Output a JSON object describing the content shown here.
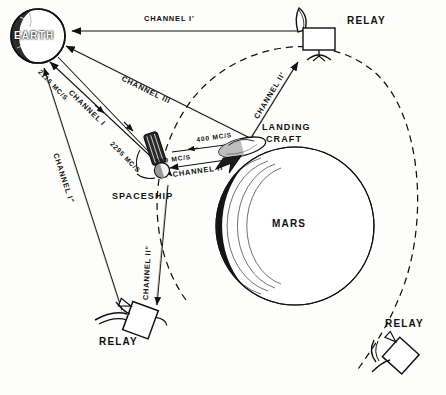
{
  "diagram": {
    "ink_color": "#111111",
    "paper_color": "#fdfdfb"
  },
  "bodies": [
    {
      "id": "earth",
      "label": "EARTH",
      "type": "planet"
    },
    {
      "id": "mars",
      "label": "MARS",
      "type": "planet"
    }
  ],
  "craft": [
    {
      "id": "spaceship",
      "label": "SPACESHIP",
      "type": "orbiter"
    },
    {
      "id": "landing-craft",
      "label": "LANDING\nCRAFT",
      "label_line1": "LANDING",
      "label_line2": "CRAFT",
      "type": "lander"
    },
    {
      "id": "relay-top",
      "label": "RELAY",
      "type": "relay-satellite"
    },
    {
      "id": "relay-bottom",
      "label": "RELAY",
      "type": "relay-satellite"
    },
    {
      "id": "relay-right",
      "label": "RELAY",
      "type": "relay-satellite"
    }
  ],
  "channels": [
    {
      "id": "channel-1-prime",
      "label": "CHANNEL I'",
      "from": "relay-top",
      "to": "earth"
    },
    {
      "id": "channel-3",
      "label": "CHANNEL III",
      "from": "landing-craft",
      "to": "earth"
    },
    {
      "id": "channel-1",
      "label": "CHANNEL I",
      "from": "spaceship",
      "to": "earth",
      "frequency_up": "2115 MC/S",
      "frequency_down": "2295 MC/S"
    },
    {
      "id": "channel-1-dprime",
      "label": "CHANNEL I\"",
      "from": "relay-bottom",
      "to": "earth"
    },
    {
      "id": "channel-2",
      "label": "CHANNEL II",
      "from": "landing-craft",
      "to": "spaceship",
      "frequency_up": "400 MC/S",
      "frequency_down": "380 MC/S"
    },
    {
      "id": "channel-2-prime",
      "label": "CHANNEL II'",
      "from": "landing-craft",
      "to": "relay-top"
    },
    {
      "id": "channel-2-dprime",
      "label": "CHANNEL II\"",
      "from": "spaceship",
      "to": "relay-bottom"
    }
  ],
  "frequencies": {
    "uplink_earth": "2115 MC/S",
    "downlink_earth": "2295 MC/S",
    "uplink_local": "400 MC/S",
    "downlink_local": "380 MC/S"
  },
  "labels": {
    "earth": "EARTH",
    "mars": "MARS",
    "spaceship": "SPACESHIP",
    "landing_craft_1": "LANDING",
    "landing_craft_2": "CRAFT",
    "relay_top": "RELAY",
    "relay_bottom": "RELAY",
    "relay_right": "RELAY",
    "channel_1_prime": "CHANNEL I'",
    "channel_3": "CHANNEL III",
    "channel_1": "CHANNEL I",
    "channel_1_dprime": "CHANNEL I\"",
    "channel_2": "CHANNEL II",
    "channel_2_prime": "CHANNEL II'",
    "channel_2_dprime": "CHANNEL II\"",
    "freq_2115": "2115 MC/S",
    "freq_2295": "2295 MC/S",
    "freq_400": "400 MC/S",
    "freq_380": "380 MC/S"
  }
}
